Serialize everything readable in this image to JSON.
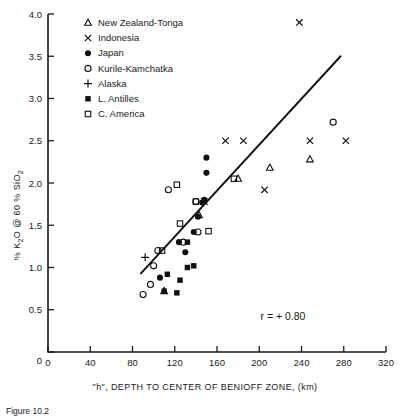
{
  "chart_data": {
    "type": "scatter",
    "title": "",
    "xlabel": "\"h\", DEPTH TO CENTER OF BENIOFF ZONE, (km)",
    "ylabel": "% K2O @ 60 % SiO2",
    "ylabel_parts": {
      "pre": "% K",
      "sub1": "2",
      "mid": "O @ 60 % SiO",
      "sub2": "2"
    },
    "xlim": [
      0,
      320
    ],
    "ylim": [
      0,
      4.0
    ],
    "xticks": [
      0,
      40,
      80,
      120,
      160,
      200,
      240,
      280,
      320
    ],
    "xticklabels": [
      "0",
      "40",
      "80",
      "120",
      "160",
      "200",
      "240",
      "280",
      "320"
    ],
    "yticks": [
      0,
      0.5,
      1.0,
      1.5,
      2.0,
      2.5,
      3.0,
      3.5,
      4.0
    ],
    "yticklabels": [
      "0",
      "0.5",
      "1.0",
      "1.5",
      "2.0",
      "2.5",
      "3.0",
      "3.5",
      "4.0"
    ],
    "grid": false,
    "legend_position": "upper-left-inside",
    "annotation": "r = + 0.80",
    "annotation_xy": [
      250,
      0.72
    ],
    "trendline": {
      "label": "least-squares fit",
      "x": [
        88,
        277
      ],
      "y": [
        0.93,
        3.5
      ]
    },
    "series": [
      {
        "name": "New Zealand-Tonga",
        "marker": "triangle-open",
        "points": [
          {
            "x": 110,
            "y": 0.72
          },
          {
            "x": 143,
            "y": 1.62
          },
          {
            "x": 180,
            "y": 2.05
          },
          {
            "x": 210,
            "y": 2.18
          },
          {
            "x": 248,
            "y": 2.28
          }
        ]
      },
      {
        "name": "Indonesia",
        "marker": "x",
        "points": [
          {
            "x": 148,
            "y": 1.78
          },
          {
            "x": 168,
            "y": 2.5
          },
          {
            "x": 185,
            "y": 2.5
          },
          {
            "x": 205,
            "y": 1.92
          },
          {
            "x": 238,
            "y": 3.9
          },
          {
            "x": 248,
            "y": 2.5
          },
          {
            "x": 282,
            "y": 2.5
          }
        ]
      },
      {
        "name": "Japan",
        "marker": "circle-solid",
        "points": [
          {
            "x": 106,
            "y": 0.88
          },
          {
            "x": 124,
            "y": 1.3
          },
          {
            "x": 130,
            "y": 1.18
          },
          {
            "x": 138,
            "y": 1.42
          },
          {
            "x": 142,
            "y": 1.6
          },
          {
            "x": 146,
            "y": 1.77
          },
          {
            "x": 150,
            "y": 2.12
          },
          {
            "x": 150,
            "y": 2.3
          },
          {
            "x": 148,
            "y": 1.8
          }
        ]
      },
      {
        "name": "Kurile-Kamchatka",
        "marker": "circle-open",
        "points": [
          {
            "x": 90,
            "y": 0.68
          },
          {
            "x": 97,
            "y": 0.8
          },
          {
            "x": 100,
            "y": 1.02
          },
          {
            "x": 104,
            "y": 1.2
          },
          {
            "x": 114,
            "y": 1.92
          },
          {
            "x": 128,
            "y": 1.3
          },
          {
            "x": 140,
            "y": 1.78
          },
          {
            "x": 142,
            "y": 1.42
          },
          {
            "x": 270,
            "y": 2.72
          }
        ]
      },
      {
        "name": "Alaska",
        "marker": "plus",
        "points": [
          {
            "x": 92,
            "y": 1.12
          }
        ]
      },
      {
        "name": "L. Antilles",
        "marker": "square-solid",
        "points": [
          {
            "x": 110,
            "y": 0.72
          },
          {
            "x": 113,
            "y": 0.92
          },
          {
            "x": 122,
            "y": 0.7
          },
          {
            "x": 125,
            "y": 0.85
          },
          {
            "x": 132,
            "y": 1.0
          },
          {
            "x": 138,
            "y": 1.02
          },
          {
            "x": 132,
            "y": 1.3
          }
        ]
      },
      {
        "name": "C. America",
        "marker": "square-open",
        "points": [
          {
            "x": 108,
            "y": 1.2
          },
          {
            "x": 122,
            "y": 1.98
          },
          {
            "x": 125,
            "y": 1.52
          },
          {
            "x": 140,
            "y": 1.78
          },
          {
            "x": 152,
            "y": 1.43
          },
          {
            "x": 176,
            "y": 2.05
          }
        ]
      }
    ],
    "legend_entries": [
      {
        "label": "New Zealand-Tonga",
        "marker": "triangle-open"
      },
      {
        "label": "Indonesia",
        "marker": "x"
      },
      {
        "label": "Japan",
        "marker": "circle-solid"
      },
      {
        "label": "Kurile-Kamchatka",
        "marker": "circle-open"
      },
      {
        "label": "Alaska",
        "marker": "plus"
      },
      {
        "label": "L. Antilles",
        "marker": "square-solid"
      },
      {
        "label": "C. America",
        "marker": "square-open"
      }
    ]
  },
  "caption": {
    "text": "Figure 10.2"
  },
  "colors": {
    "ink": "#111111",
    "background": "#ffffff"
  }
}
